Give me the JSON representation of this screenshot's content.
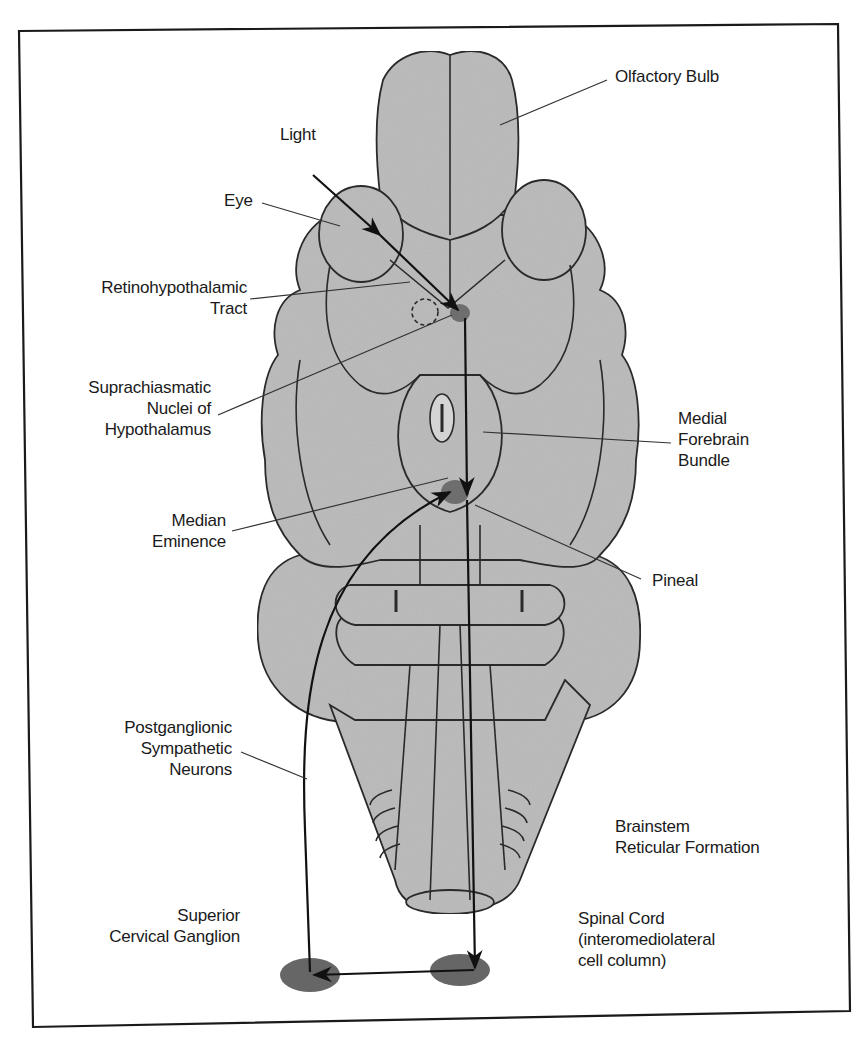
{
  "figure": {
    "type": "annotated anatomical diagram",
    "colors": {
      "brain_fill": "#bdbdbd",
      "brain_outline": "#2a2a2a",
      "nucleus_fill": "#6e6e6e",
      "ganglion_fill": "#6a6a6a",
      "frame": "#1a1a1a",
      "background": "#ffffff"
    },
    "labels": {
      "olfactory_bulb": [
        "Olfactory Bulb"
      ],
      "light": [
        "Light"
      ],
      "eye": [
        "Eye"
      ],
      "retinohypothalamic_tract": [
        "Retinohypothalamic",
        "Tract"
      ],
      "suprachiasmatic": [
        "Suprachiasmatic",
        "Nuclei of",
        "Hypothalamus"
      ],
      "medial_forebrain_bundle": [
        "Medial",
        "Forebrain",
        "Bundle"
      ],
      "median_eminence": [
        "Median",
        "Eminence"
      ],
      "pineal": [
        "Pineal"
      ],
      "postganglionic": [
        "Postganglionic",
        "Sympathetic",
        "Neurons"
      ],
      "brainstem_reticular": [
        "Brainstem",
        "Reticular Formation"
      ],
      "superior_cervical_ganglion": [
        "Superior",
        "Cervical Ganglion"
      ],
      "spinal_cord": [
        "Spinal Cord",
        "(interomediolateral",
        "cell column)"
      ]
    },
    "pathway": [
      "Light",
      "Eye",
      "Retinohypothalamic Tract",
      "Suprachiasmatic Nuclei of Hypothalamus",
      "Medial Forebrain Bundle",
      "Brainstem Reticular Formation",
      "Spinal Cord (interomediolateral cell column)",
      "Superior Cervical Ganglion",
      "Postganglionic Sympathetic Neurons",
      "Pineal"
    ]
  }
}
